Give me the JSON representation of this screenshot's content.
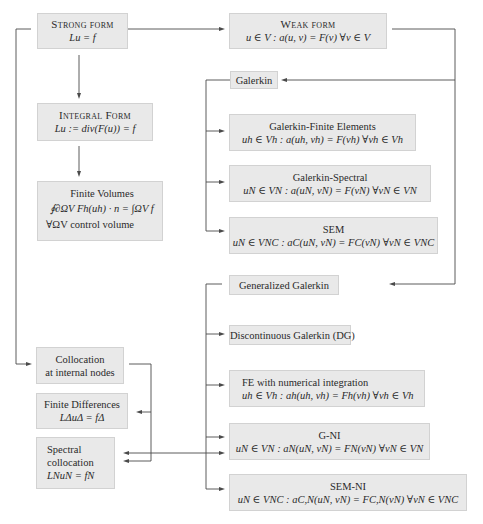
{
  "left_column": {
    "strong_form": {
      "title": "Strong form",
      "equation": "Lu = f"
    },
    "integral_form": {
      "title": "Integral Form",
      "equation": "Lu := div(F(u)) = f"
    },
    "finite_volumes": {
      "title": "Finite Volumes",
      "equation": "∮∂ΩV Fh(uh) · n = ∫ΩV f",
      "note": "∀ΩV control volume"
    },
    "collocation": {
      "line1": "Collocation",
      "line2": "at internal nodes"
    },
    "finite_differences": {
      "title": "Finite Differences",
      "equation": "LΔuΔ = fΔ"
    },
    "spectral_collocation": {
      "line1": "Spectral",
      "line2": "collocation",
      "equation": "LNuN = fN"
    }
  },
  "right_column": {
    "weak_form": {
      "title": "Weak form",
      "equation": "u ∈ V : a(u, v) = F(v) ∀v ∈ V"
    },
    "galerkin": {
      "label": "Galerkin"
    },
    "galerkin_fe": {
      "title": "Galerkin-Finite Elements",
      "equation": "uh ∈ Vh : a(uh, vh) = F(vh) ∀vh ∈ Vh"
    },
    "galerkin_spectral": {
      "title": "Galerkin-Spectral",
      "equation": "uN ∈ VN : a(uN, vN) = F(vN) ∀vN ∈ VN"
    },
    "sem": {
      "title": "SEM",
      "equation": "uN ∈ VNC : aC(uN, vN) = FC(vN) ∀vN ∈ VNC"
    },
    "generalized_galerkin": {
      "label": "Generalized Galerkin"
    },
    "dg": {
      "label": "Discontinuous Galerkin (DG)"
    },
    "fe_ni": {
      "title": "FE with numerical integration",
      "equation": "uh ∈ Vh : ah(uh, vh) = Fh(vh) ∀vh ∈ Vh"
    },
    "g_ni": {
      "title": "G-NI",
      "equation": "uN ∈ VN : aN(uN, vN) = FN(vN) ∀vN ∈ VN"
    },
    "sem_ni": {
      "title": "SEM-NI",
      "equation": "uN ∈ VNC : aC,N(uN, vN) = FC,N(vN) ∀vN ∈ VNC"
    }
  },
  "colors": {
    "box_fill": "#e9e9e9",
    "box_border": "#d2d2d2",
    "line": "#4a4a4a",
    "text": "#2a2a2a"
  }
}
